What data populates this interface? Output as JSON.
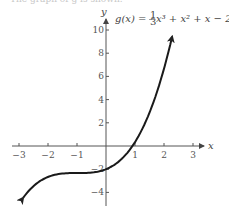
{
  "header": {
    "cut_off_text": "The graph of g is shown."
  },
  "chart_data": {
    "type": "line",
    "formula": {
      "lhs": "g(x) = ",
      "num": "1",
      "den": "3",
      "rest": "x³ + x² + x − 2"
    },
    "xlabel": "x",
    "ylabel": "y",
    "xlim": [
      -3,
      3
    ],
    "ylim": [
      -4,
      10
    ],
    "x_ticks": [
      -3,
      -2,
      -1,
      1,
      2,
      3
    ],
    "x_tick_labels": [
      "−3",
      "−2",
      "−1",
      "1",
      "2",
      "3"
    ],
    "y_ticks": [
      10,
      8,
      6,
      4,
      2,
      -2,
      -4
    ],
    "y_tick_labels": [
      "10",
      "8",
      "6",
      "4",
      "2",
      "−2",
      "−4"
    ],
    "grid": false,
    "series": [
      {
        "name": "g(x)",
        "function": "x^3/3 + x^2 + x - 2",
        "domain": [
          -2.86,
          2.28
        ],
        "x": [
          -2.86,
          -2,
          -1,
          0,
          1,
          2,
          2.28
        ],
        "values": [
          -4.48,
          -2.67,
          -2.33,
          -2,
          1.33,
          6.67,
          9.43
        ],
        "arrows_both_ends": true
      }
    ]
  }
}
